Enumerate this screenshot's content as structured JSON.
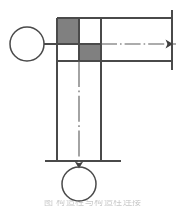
{
  "figure": {
    "title": "",
    "caption": "图   构造柱与构造柱连接",
    "background_color": "#ffffff",
    "line_color": "#4a4a4a",
    "shade_color": "#808080",
    "centerline_color": "#5a5a5a"
  },
  "elements": {
    "left_node": {
      "name": "left circle node",
      "cx": 27,
      "cy": 44,
      "r": 17,
      "fill": "none",
      "stroke": "#4a4a4a"
    },
    "bottom_node": {
      "name": "bottom circle node",
      "cx": 79,
      "cy": 184,
      "r": 17,
      "fill": "none",
      "stroke": "#4a4a4a"
    },
    "left_connector": {
      "name": "left connecting line",
      "x1": 44,
      "y1": 44,
      "x2": 57,
      "y2": 44
    },
    "horizontal_member": {
      "name": "horizontal member",
      "top_y": 18,
      "bottom_y": 61,
      "left_x": 57,
      "right_x": 172
    },
    "vertical_member": {
      "name": "vertical member",
      "left_x": 57,
      "right_x": 101,
      "top_y": 18,
      "bottom_y": 161
    },
    "right_end_line": {
      "name": "right end vertical line",
      "x": 172,
      "y1": 10,
      "y2": 70
    },
    "bottom_end_line": {
      "name": "bottom end horizontal line",
      "y": 161,
      "x1": 45,
      "x2": 121
    },
    "grid": {
      "name": "checkerboard junction zone",
      "columns": [
        57,
        79,
        101
      ],
      "rows": [
        18,
        44,
        61
      ],
      "cells": [
        {
          "row": 0,
          "col": 0,
          "shaded": true
        },
        {
          "row": 0,
          "col": 1,
          "shaded": false
        },
        {
          "row": 1,
          "col": 0,
          "shaded": false
        },
        {
          "row": 1,
          "col": 1,
          "shaded": true
        }
      ]
    },
    "centerline_horizontal": {
      "name": "horizontal centerline",
      "y": 44,
      "x1": 101,
      "x2": 176
    },
    "centerline_vertical": {
      "name": "vertical centerline",
      "x": 79,
      "y1": 61,
      "y2": 167
    },
    "arrow_right": {
      "name": "right arrow marker",
      "x": 172,
      "y": 44,
      "direction": "right"
    },
    "arrow_down": {
      "name": "down arrow marker",
      "x": 79,
      "y": 167,
      "direction": "down"
    }
  }
}
